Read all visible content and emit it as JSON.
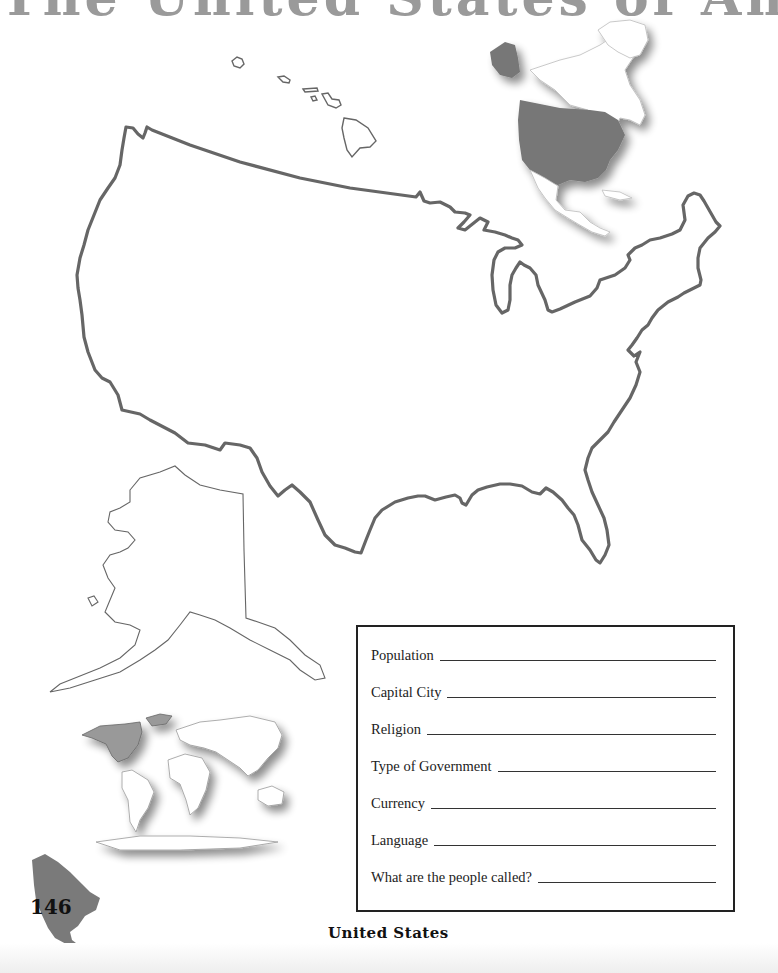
{
  "page": {
    "title": "The United States of America",
    "footer_label": "United States",
    "page_number": "146"
  },
  "maps": {
    "main": "contiguous-united-states-outline",
    "alaska": "alaska-outline",
    "hawaii": "hawaii-islands-outline",
    "locator_north_america": "north-america-locator-us-highlighted",
    "locator_world": "world-locator-north-america-highlighted",
    "page_corner": "north-america-silhouette"
  },
  "colors": {
    "outline": "#666666",
    "highlight": "#777777",
    "text": "#222222"
  },
  "info_box": {
    "fields": [
      {
        "label": "Population",
        "value": ""
      },
      {
        "label": "Capital City",
        "value": ""
      },
      {
        "label": "Religion",
        "value": ""
      },
      {
        "label": "Type of Government",
        "value": ""
      },
      {
        "label": "Currency",
        "value": ""
      },
      {
        "label": "Language",
        "value": ""
      },
      {
        "label": "What are the people called?",
        "value": ""
      }
    ]
  }
}
